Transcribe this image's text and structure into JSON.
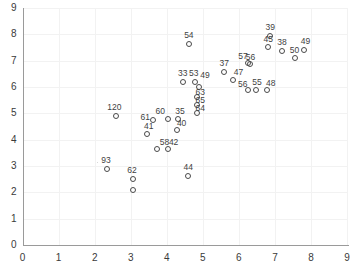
{
  "chart_data": {
    "type": "scatter",
    "title": "",
    "xlabel": "",
    "ylabel": "",
    "xlim": [
      0,
      9
    ],
    "ylim": [
      0,
      9
    ],
    "xticks": [
      0,
      1,
      2,
      3,
      4,
      5,
      6,
      7,
      8,
      9
    ],
    "yticks": [
      0,
      1,
      2,
      3,
      4,
      5,
      6,
      7,
      8,
      9
    ],
    "grid": true,
    "legend": "none",
    "marker": "open-circle",
    "marker_color": "#4a4a4a",
    "grid_color": "#f2f2f2",
    "axis_color": "#9a9a9a",
    "background": "#ffffff",
    "points": [
      {
        "label": "120",
        "x": 2.6,
        "y": 4.9
      },
      {
        "label": "93",
        "x": 2.35,
        "y": 2.9
      },
      {
        "label": "62",
        "x": 3.07,
        "y": 2.52
      },
      {
        "label": "62b",
        "x": 3.07,
        "y": 2.1
      },
      {
        "label": "61",
        "x": 3.63,
        "y": 4.74
      },
      {
        "label": "41",
        "x": 3.45,
        "y": 4.22
      },
      {
        "label": "58",
        "x": 3.72,
        "y": 3.66
      },
      {
        "label": "42",
        "x": 4.03,
        "y": 3.66
      },
      {
        "label": "60",
        "x": 4.02,
        "y": 4.78
      },
      {
        "label": "35",
        "x": 4.32,
        "y": 4.78
      },
      {
        "label": "40",
        "x": 4.28,
        "y": 4.36
      },
      {
        "label": "44",
        "x": 4.6,
        "y": 2.62
      },
      {
        "label": "33",
        "x": 4.45,
        "y": 6.18
      },
      {
        "label": "53",
        "x": 4.78,
        "y": 6.2
      },
      {
        "label": "49b",
        "x": 4.9,
        "y": 6.0
      },
      {
        "label": "63",
        "x": 4.85,
        "y": 5.62
      },
      {
        "label": "65",
        "x": 4.85,
        "y": 5.3
      },
      {
        "label": "64",
        "x": 4.85,
        "y": 5.0
      },
      {
        "label": "54",
        "x": 4.62,
        "y": 7.62
      },
      {
        "label": "37",
        "x": 5.6,
        "y": 6.55
      },
      {
        "label": "47",
        "x": 5.83,
        "y": 6.28
      },
      {
        "label": "57",
        "x": 6.26,
        "y": 6.9
      },
      {
        "label": "56b",
        "x": 6.3,
        "y": 6.88
      },
      {
        "label": "56",
        "x": 6.25,
        "y": 5.88
      },
      {
        "label": "55",
        "x": 6.48,
        "y": 5.88
      },
      {
        "label": "48",
        "x": 6.78,
        "y": 5.88
      },
      {
        "label": "39",
        "x": 6.85,
        "y": 7.92
      },
      {
        "label": "45",
        "x": 6.82,
        "y": 7.52
      },
      {
        "label": "38",
        "x": 7.2,
        "y": 7.38
      },
      {
        "label": "50",
        "x": 7.55,
        "y": 7.1
      },
      {
        "label": "49",
        "x": 7.8,
        "y": 7.4
      }
    ],
    "point_labels": [
      {
        "text": "120",
        "x": 2.6,
        "y": 4.9,
        "dx": -9,
        "dy": -13
      },
      {
        "text": "93",
        "x": 2.35,
        "y": 2.9,
        "dx": -6,
        "dy": -13
      },
      {
        "text": "62",
        "x": 3.07,
        "y": 2.52,
        "dx": -6,
        "dy": -13
      },
      {
        "text": "61",
        "x": 3.63,
        "y": 4.74,
        "dx": -13,
        "dy": -7
      },
      {
        "text": "41",
        "x": 3.45,
        "y": 4.22,
        "dx": -3,
        "dy": -12
      },
      {
        "text": "58",
        "x": 3.72,
        "y": 3.66,
        "dx": 3,
        "dy": -11
      },
      {
        "text": "42",
        "x": 4.03,
        "y": 3.66,
        "dx": 1,
        "dy": -11
      },
      {
        "text": "60",
        "x": 4.02,
        "y": 4.78,
        "dx": -12,
        "dy": -12
      },
      {
        "text": "35",
        "x": 4.32,
        "y": 4.78,
        "dx": -3,
        "dy": -12
      },
      {
        "text": "40",
        "x": 4.28,
        "y": 4.36,
        "dx": 0,
        "dy": -11
      },
      {
        "text": "44",
        "x": 4.6,
        "y": 2.62,
        "dx": -5,
        "dy": -13
      },
      {
        "text": "33",
        "x": 4.45,
        "y": 6.18,
        "dx": -5,
        "dy": -13
      },
      {
        "text": "53",
        "x": 4.78,
        "y": 6.2,
        "dx": -6,
        "dy": -13
      },
      {
        "text": "49",
        "x": 4.9,
        "y": 6.0,
        "dx": 1,
        "dy": -16
      },
      {
        "text": "63",
        "x": 4.85,
        "y": 5.62,
        "dx": -2,
        "dy": -9
      },
      {
        "text": "65",
        "x": 4.85,
        "y": 5.3,
        "dx": -2,
        "dy": -9
      },
      {
        "text": "64",
        "x": 4.85,
        "y": 5.0,
        "dx": -2,
        "dy": -9
      },
      {
        "text": "54",
        "x": 4.62,
        "y": 7.62,
        "dx": -5,
        "dy": -13
      },
      {
        "text": "37",
        "x": 5.6,
        "y": 6.55,
        "dx": -5,
        "dy": -13
      },
      {
        "text": "47",
        "x": 5.83,
        "y": 6.28,
        "dx": 1,
        "dy": -12
      },
      {
        "text": "57",
        "x": 6.26,
        "y": 6.9,
        "dx": -10,
        "dy": -11
      },
      {
        "text": "56",
        "x": 6.3,
        "y": 6.88,
        "dx": -4,
        "dy": -11
      },
      {
        "text": "56",
        "x": 6.25,
        "y": 5.88,
        "dx": -10,
        "dy": -10
      },
      {
        "text": "55",
        "x": 6.48,
        "y": 5.88,
        "dx": -4,
        "dy": -12
      },
      {
        "text": "48",
        "x": 6.78,
        "y": 5.88,
        "dx": -1,
        "dy": -11
      },
      {
        "text": "39",
        "x": 6.85,
        "y": 7.92,
        "dx": -4,
        "dy": -13
      },
      {
        "text": "45",
        "x": 6.82,
        "y": 7.52,
        "dx": -5,
        "dy": -12
      },
      {
        "text": "38",
        "x": 7.2,
        "y": 7.38,
        "dx": -5,
        "dy": -13
      },
      {
        "text": "50",
        "x": 7.55,
        "y": 7.1,
        "dx": -5,
        "dy": -12
      },
      {
        "text": "49",
        "x": 7.8,
        "y": 7.4,
        "dx": -3,
        "dy": -13
      }
    ]
  },
  "geometry": {
    "origin_px_x": 22.6,
    "origin_px_y": 245.0,
    "unit_px_x": 36.05,
    "unit_px_y": 26.35
  }
}
